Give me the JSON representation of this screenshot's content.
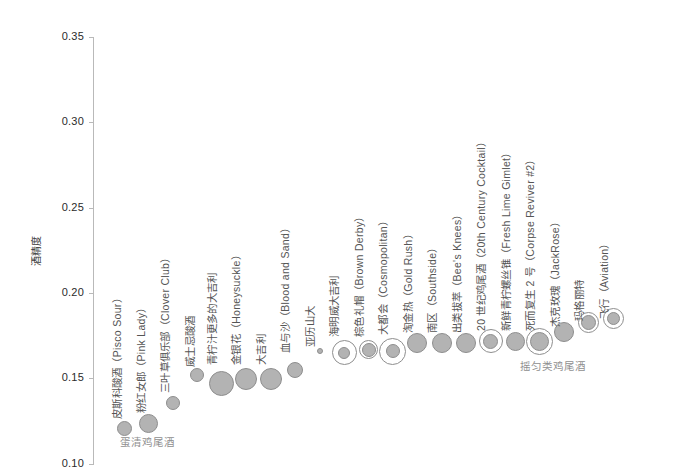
{
  "chart_data": {
    "type": "scatter",
    "title": "",
    "xlabel": "",
    "ylabel": "酒精度",
    "ylim": [
      0.1,
      0.35
    ],
    "yticks": [
      0.1,
      0.15,
      0.2,
      0.25,
      0.3,
      0.35
    ],
    "ytick_labels": [
      "0.10",
      "0.15",
      "0.20",
      "0.25",
      "0.30",
      "0.35"
    ],
    "grid": false,
    "legend": "none",
    "marker_note": "bubble size encodes volume; outer ring encodes a second category",
    "categories": [
      "皮斯科酸酒（Pisco Sour）",
      "粉红女郎（Pink Lady）",
      "三叶草俱乐部（Clover Club）",
      "威士忌酸酒",
      "青柠汁更多的大吉利",
      "金银花（Honeysuckle）",
      "大吉利",
      "血与沙（Blood and Sand）",
      "亚历山大",
      "海明威大吉利",
      "棕色礼帽（Brown Derby）",
      "大都会（Cosmopolitan）",
      "淘金热（Gold Rush）",
      "南区（Southside）",
      "出类拔萃（Bee's Knees）",
      "20 世纪鸡尾酒（20th Century Cocktail）",
      "新鲜青柠螺丝锥（Fresh Lime Gimlet）",
      "死而复生 2 号（Corpse Reviver #2）",
      "杰克玫瑰（JackRose）",
      "玛格丽特",
      "飞行（Aviation）"
    ],
    "values": [
      0.121,
      0.124,
      0.136,
      0.152,
      0.147,
      0.15,
      0.15,
      0.155,
      0.166,
      0.165,
      0.167,
      0.166,
      0.171,
      0.171,
      0.171,
      0.172,
      0.172,
      0.172,
      0.177,
      0.183,
      0.185
    ],
    "sizes": [
      15,
      19,
      14,
      14,
      25,
      22,
      22,
      16,
      6,
      12,
      14,
      14,
      20,
      20,
      20,
      15,
      19,
      19,
      20,
      15,
      13
    ],
    "ring_sizes": [
      0,
      0,
      0,
      0,
      0,
      0,
      0,
      0,
      0,
      25,
      19,
      27,
      0,
      0,
      0,
      24,
      0,
      27,
      0,
      21,
      21
    ],
    "annotations": [
      {
        "text": "蛋清鸡尾酒",
        "x": 120,
        "y": 434
      },
      {
        "text": "摇匀类鸡尾酒",
        "x": 520,
        "y": 358
      }
    ]
  },
  "axis": {
    "y_title": "酒精度",
    "ticks": [
      "0.35",
      "0.30",
      "0.25",
      "0.20",
      "0.15",
      "0.10"
    ]
  },
  "colors": {
    "marker_fill": "#b3b3b3",
    "marker_stroke": "#8e8e8e",
    "axis": "#b9b9b9",
    "tick_text": "#2b2b2b",
    "label_text": "#555555",
    "annotation_text": "#8f8f8f",
    "background": "#ffffff"
  },
  "point_labels": [
    {
      "text": "皮斯科酸酒（Pisco Sour）",
      "x": 124,
      "y": 404
    },
    {
      "text": "粉红女郎（Pink Lady）",
      "x": 148,
      "y": 398
    },
    {
      "text": "三叶草俱乐部（Clover Club）",
      "x": 172,
      "y": 378
    },
    {
      "text": "威士忌酸酒",
      "x": 197,
      "y": 352
    },
    {
      "text": "青柠汁更多的大吉利",
      "x": 219,
      "y": 350
    },
    {
      "text": "金银花（Honeysuckle）",
      "x": 243,
      "y": 350
    },
    {
      "text": "大吉利",
      "x": 268,
      "y": 350
    },
    {
      "text": "血与沙（Blood and Sand）",
      "x": 292,
      "y": 338
    },
    {
      "text": "亚历山大",
      "x": 317,
      "y": 332
    },
    {
      "text": "海明威大吉利",
      "x": 341,
      "y": 322
    },
    {
      "text": "棕色礼帽（Brown Derby）",
      "x": 366,
      "y": 322
    },
    {
      "text": "大都会（Cosmopolitan）",
      "x": 390,
      "y": 320
    },
    {
      "text": "淘金热（Gold Rush）",
      "x": 415,
      "y": 318
    },
    {
      "text": "南区（Southside）",
      "x": 439,
      "y": 318
    },
    {
      "text": "出类拔萃（Bee's Knees）",
      "x": 464,
      "y": 318
    },
    {
      "text": "20 世纪鸡尾酒（20th Century Cocktail）",
      "x": 488,
      "y": 316
    },
    {
      "text": "新鲜青柠螺丝锥（Fresh Lime Gimlet）",
      "x": 513,
      "y": 316
    },
    {
      "text": "死而复生 2 号（Corpse Reviver #2）",
      "x": 537,
      "y": 316
    },
    {
      "text": "杰克玫瑰（JackRose）",
      "x": 562,
      "y": 312
    },
    {
      "text": "玛格丽特",
      "x": 586,
      "y": 306
    },
    {
      "text": "飞行（Aviation）",
      "x": 611,
      "y": 304
    }
  ]
}
